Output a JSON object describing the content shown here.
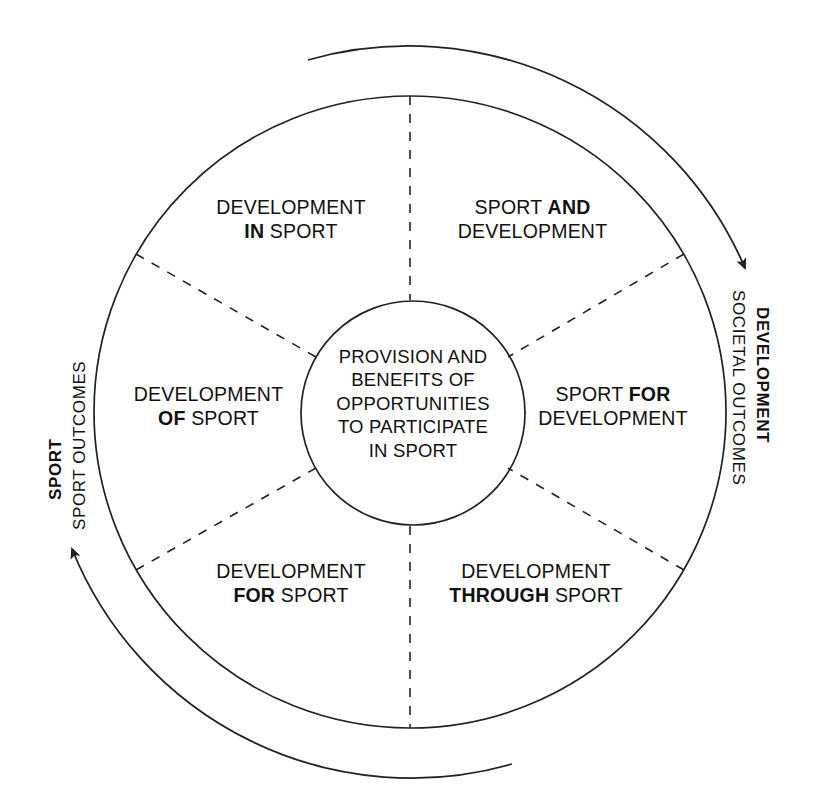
{
  "diagram": {
    "center": {
      "lines": [
        "PROVISION AND",
        "BENEFITS OF",
        "OPPORTUNITIES",
        "TO PARTICIPATE",
        "IN SPORT"
      ]
    },
    "segments": [
      {
        "id": "development-in-sport",
        "position": "top-left",
        "line1_pre": "DEVELOPMENT",
        "line1_em": "",
        "line1_post": "",
        "line2_pre": "",
        "line2_em": "IN",
        "line2_post": " SPORT"
      },
      {
        "id": "sport-and-development",
        "position": "top-right",
        "line1_pre": "SPORT ",
        "line1_em": "AND",
        "line1_post": "",
        "line2_pre": "DEVELOPMENT",
        "line2_em": "",
        "line2_post": ""
      },
      {
        "id": "development-of-sport",
        "position": "left",
        "line1_pre": "DEVELOPMENT",
        "line1_em": "",
        "line1_post": "",
        "line2_pre": "",
        "line2_em": "OF",
        "line2_post": " SPORT"
      },
      {
        "id": "sport-for-development",
        "position": "right",
        "line1_pre": "SPORT ",
        "line1_em": "FOR",
        "line1_post": "",
        "line2_pre": "DEVELOPMENT",
        "line2_em": "",
        "line2_post": ""
      },
      {
        "id": "development-for-sport",
        "position": "bottom-left",
        "line1_pre": "DEVELOPMENT",
        "line1_em": "",
        "line1_post": "",
        "line2_pre": "",
        "line2_em": "FOR",
        "line2_post": " SPORT"
      },
      {
        "id": "development-through-sport",
        "position": "bottom-right",
        "line1_pre": "DEVELOPMENT",
        "line1_em": "",
        "line1_post": "",
        "line2_pre": "",
        "line2_em": "THROUGH",
        "line2_post": " SPORT"
      }
    ],
    "axes": {
      "left": {
        "bold": "SPORT",
        "plain": "SPORT OUTCOMES",
        "arrow_direction": "up"
      },
      "right": {
        "bold": "DEVELOPMENT",
        "plain": "SOCIETAL OUTCOMES",
        "arrow_direction": "down"
      }
    },
    "colors": {
      "stroke": "#222222",
      "text": "#111111",
      "background": "#ffffff"
    }
  }
}
